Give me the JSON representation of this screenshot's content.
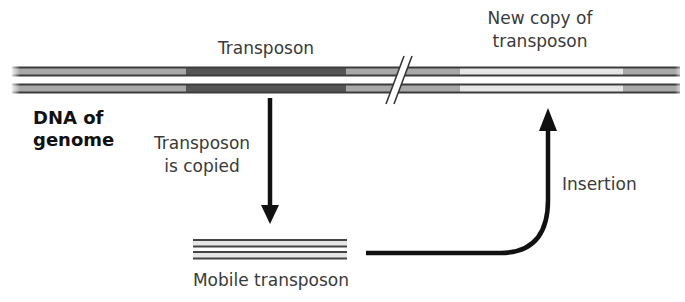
{
  "diagram": {
    "labels": {
      "transposon": "Transposon",
      "new_copy_line1": "New copy of",
      "new_copy_line2": "transposon",
      "dna_line1": "DNA of",
      "dna_line2": "genome",
      "copied_line1": "Transposon",
      "copied_line2": "is copied",
      "insertion": "Insertion",
      "mobile": "Mobile transposon"
    },
    "genome_strands": {
      "y_top": [
        67,
        87
      ],
      "segments": [
        {
          "name": "flank-left",
          "x_start": 12,
          "x_end": 186,
          "color": "#a8a8a8"
        },
        {
          "name": "transposon",
          "x_start": 186,
          "x_end": 346,
          "color": "#555555"
        },
        {
          "name": "flank-middle",
          "x_start": 346,
          "x_end": 460,
          "color": "#a8a8a8"
        },
        {
          "name": "new-copy",
          "x_start": 460,
          "x_end": 623,
          "color": "#e6e6e6"
        },
        {
          "name": "flank-right",
          "x_start": 623,
          "x_end": 680,
          "color": "#a8a8a8"
        }
      ],
      "break_marker_x": 402,
      "edge_color": "#3c3c3c"
    },
    "mobile_transposon": {
      "x_start": 193,
      "x_end": 347,
      "y_top": [
        240,
        257
      ],
      "fill_color": "#e6e6e6",
      "edge_color": "#444444"
    },
    "arrows": {
      "copy_arrow": {
        "from": [
          270,
          98
        ],
        "to": [
          270,
          223
        ]
      },
      "insertion_arrow": {
        "start": [
          366,
          253
        ],
        "corner": [
          548,
          253
        ],
        "end": [
          548,
          108
        ]
      },
      "color": "#111111"
    }
  }
}
